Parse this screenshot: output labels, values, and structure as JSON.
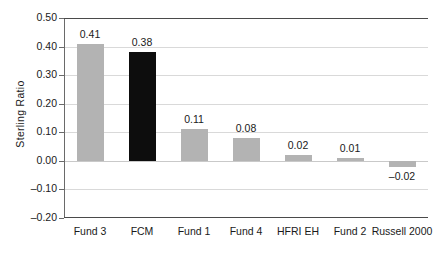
{
  "chart_data": {
    "type": "bar",
    "title": "",
    "xlabel": "",
    "ylabel": "Sterling  Ratio",
    "categories": [
      "Fund 3",
      "FCM",
      "Fund 1",
      "Fund 4",
      "HFRI EH",
      "Fund 2",
      "Russell 2000"
    ],
    "values": [
      0.41,
      0.38,
      0.11,
      0.08,
      0.02,
      0.01,
      -0.02
    ],
    "value_labels": [
      "0.41",
      "0.38",
      "0.11",
      "0.08",
      "0.02",
      "0.01",
      "–0.02"
    ],
    "bar_colors": [
      "#b3b3b3",
      "#0d0d0d",
      "#b3b3b3",
      "#b3b3b3",
      "#b3b3b3",
      "#b3b3b3",
      "#b3b3b3"
    ],
    "highlight_category": "FCM",
    "ylim": [
      -0.2,
      0.5
    ],
    "ytick_labels": [
      "0.50",
      "0.40",
      "0.30",
      "0.20",
      "0.10",
      "0.00",
      "–0.10",
      "–0.20"
    ],
    "ytick_values": [
      0.5,
      0.4,
      0.3,
      0.2,
      0.1,
      0.0,
      -0.1,
      -0.2
    ],
    "grid": true,
    "grid_axis": "y",
    "legend": false,
    "legend_position": "none",
    "series": [
      {
        "name": "Sterling Ratio",
        "values": [
          0.41,
          0.38,
          0.11,
          0.08,
          0.02,
          0.01,
          -0.02
        ]
      }
    ],
    "colors": {
      "bar_default": "#b3b3b3",
      "bar_highlight": "#0d0d0d",
      "gridline": "#d9d9d9",
      "axis": "#4a4a4a",
      "text": "#1a1a1a",
      "background": "#ffffff"
    }
  }
}
